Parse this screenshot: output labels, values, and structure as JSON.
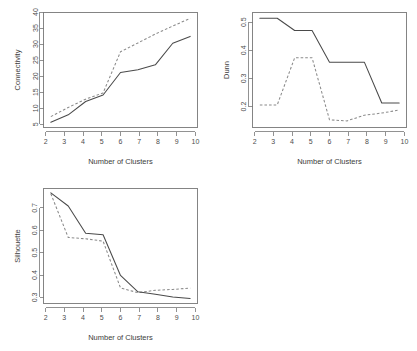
{
  "figure": {
    "background_color": "#ffffff",
    "layout": "2x2 grid, bottom-right panel empty",
    "panels": [
      "connectivity",
      "dunn",
      "silhouette"
    ]
  },
  "chart_data": [
    {
      "id": "connectivity",
      "type": "line",
      "title": "",
      "xlabel": "Number of Clusters",
      "ylabel": "Connectivity",
      "x": [
        2,
        3,
        4,
        5,
        6,
        7,
        8,
        9,
        10
      ],
      "xticklabels": [
        "2",
        "3",
        "4",
        "5",
        "6",
        "7",
        "8",
        "9",
        "10"
      ],
      "yticks": [
        5,
        10,
        15,
        20,
        25,
        30,
        35,
        40
      ],
      "yticklabels": [
        "5",
        "10",
        "15",
        "20",
        "25",
        "30",
        "35",
        "40"
      ],
      "xlim": [
        1.7,
        10.3
      ],
      "ylim": [
        4.0,
        41.5
      ],
      "grid": false,
      "legend": "none",
      "series": [
        {
          "name": "solid",
          "style": "solid",
          "color": "#4a4a4a",
          "values": [
            5.1,
            7.6,
            12.1,
            14.3,
            21.9,
            22.8,
            24.5,
            31.8,
            34.1
          ]
        },
        {
          "name": "dashed",
          "style": "dashed",
          "color": "#8a8a8a",
          "values": [
            7.0,
            10.1,
            12.9,
            15.0,
            28.9,
            31.9,
            34.9,
            37.6,
            40.2
          ]
        }
      ]
    },
    {
      "id": "dunn",
      "type": "line",
      "title": "",
      "xlabel": "Number of Clusters",
      "ylabel": "Dunn",
      "x": [
        2,
        3,
        4,
        5,
        6,
        7,
        8,
        9,
        10
      ],
      "xticklabels": [
        "2",
        "3",
        "4",
        "5",
        "6",
        "7",
        "8",
        "9",
        "10"
      ],
      "yticks": [
        0.2,
        0.3,
        0.4,
        0.5
      ],
      "yticklabels": [
        "0.2",
        "0.3",
        "0.4",
        "0.5"
      ],
      "xlim": [
        1.7,
        10.3
      ],
      "ylim": [
        0.125,
        0.535
      ],
      "grid": false,
      "legend": "none",
      "series": [
        {
          "name": "solid",
          "style": "solid",
          "color": "#4a4a4a",
          "values": [
            0.521,
            0.521,
            0.476,
            0.476,
            0.359,
            0.359,
            0.359,
            0.208,
            0.208
          ]
        },
        {
          "name": "dashed",
          "style": "dashed",
          "color": "#8a8a8a",
          "values": [
            0.201,
            0.201,
            0.375,
            0.375,
            0.146,
            0.142,
            0.163,
            0.171,
            0.182
          ]
        }
      ]
    },
    {
      "id": "silhouette",
      "type": "line",
      "title": "",
      "xlabel": "Number of Clusters",
      "ylabel": "Silhouette",
      "x": [
        2,
        3,
        4,
        5,
        6,
        7,
        8,
        9,
        10
      ],
      "xticklabels": [
        "2",
        "3",
        "4",
        "5",
        "6",
        "7",
        "8",
        "9",
        "10"
      ],
      "yticks": [
        0.3,
        0.4,
        0.5,
        0.6,
        0.7
      ],
      "yticklabels": [
        "0.3",
        "0.4",
        "0.5",
        "0.6",
        "0.7"
      ],
      "xlim": [
        1.7,
        10.3
      ],
      "ylim": [
        0.275,
        0.79
      ],
      "grid": false,
      "legend": "none",
      "series": [
        {
          "name": "solid",
          "style": "solid",
          "color": "#4a4a4a",
          "values": [
            0.779,
            0.718,
            0.592,
            0.585,
            0.396,
            0.32,
            0.309,
            0.296,
            0.289
          ]
        },
        {
          "name": "dashed",
          "style": "dashed",
          "color": "#8a8a8a",
          "values": [
            0.775,
            0.572,
            0.566,
            0.555,
            0.338,
            0.316,
            0.327,
            0.331,
            0.337
          ]
        }
      ]
    }
  ]
}
